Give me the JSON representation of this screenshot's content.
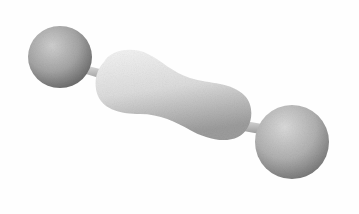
{
  "image": {
    "description": "3D rendered grey dumbbell-shaped object: two spheres connected by thin rods to a peanut-shaped central body",
    "colors": {
      "background": "#ffffff",
      "sphere_light": "#c8c8c8",
      "sphere_dark": "#6a6a6a",
      "body_light": "#f0f0f0",
      "body_dark": "#9a9a9a",
      "rod": "#bdbdbd"
    }
  }
}
